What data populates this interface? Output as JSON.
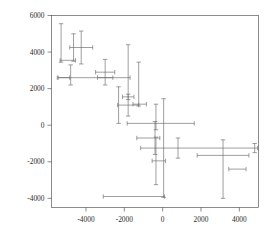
{
  "figure": {
    "background": "#ffffff",
    "line_color": "#6b6b6b",
    "axis_color": "#5a5a5a"
  },
  "chart_data": {
    "type": "scatter",
    "title": "",
    "xlabel": "",
    "ylabel": "",
    "xlim": [
      -5800,
      5000
    ],
    "ylim": [
      -4500,
      6000
    ],
    "grid": false,
    "legend": null,
    "error_bars": "both",
    "xticks": [
      -4000,
      -2000,
      0,
      2000,
      4000
    ],
    "xticklabels": [
      "-4000",
      "-2000",
      "0",
      "2000",
      "4000"
    ],
    "yticks": [
      -4000,
      -2000,
      0,
      2000,
      4000,
      6000
    ],
    "yticklabels": [
      "-4000",
      "-2000",
      "0",
      "2000",
      "4000",
      "6000"
    ],
    "points": [
      {
        "x": -5300,
        "y": 4500,
        "xerr": 0,
        "yerr": 1050
      },
      {
        "x": -5150,
        "y": 2600,
        "xerr": 300,
        "yerr": 0
      },
      {
        "x": -4950,
        "y": 3550,
        "xerr": 400,
        "yerr": 0
      },
      {
        "x": -4800,
        "y": 2750,
        "xerr": 0,
        "yerr": 550
      },
      {
        "x": -4650,
        "y": 4250,
        "xerr": 0,
        "yerr": 750
      },
      {
        "x": -4250,
        "y": 4250,
        "xerr": 600,
        "yerr": 900
      },
      {
        "x": -4050,
        "y": 2600,
        "xerr": 1450,
        "yerr": 0
      },
      {
        "x": -3000,
        "y": 2900,
        "xerr": 500,
        "yerr": 700
      },
      {
        "x": -2550,
        "y": 2600,
        "xerr": 850,
        "yerr": 0
      },
      {
        "x": -1800,
        "y": 2900,
        "xerr": 0,
        "yerr": 1500
      },
      {
        "x": -1800,
        "y": 1550,
        "xerr": 300,
        "yerr": 0
      },
      {
        "x": -2300,
        "y": 1100,
        "xerr": 0,
        "yerr": 1000
      },
      {
        "x": -1800,
        "y": 1100,
        "xerr": 550,
        "yerr": 600
      },
      {
        "x": -1250,
        "y": 2250,
        "xerr": 0,
        "yerr": 1200
      },
      {
        "x": -1200,
        "y": 1150,
        "xerr": 350,
        "yerr": 0
      },
      {
        "x": -350,
        "y": 450,
        "xerr": 0,
        "yerr": 700
      },
      {
        "x": -100,
        "y": 100,
        "xerr": 1750,
        "yerr": 0
      },
      {
        "x": -750,
        "y": -700,
        "xerr": 600,
        "yerr": 0
      },
      {
        "x": -400,
        "y": -700,
        "xerr": 0,
        "yerr": 900
      },
      {
        "x": -350,
        "y": -1950,
        "xerr": 0,
        "yerr": 1300
      },
      {
        "x": -200,
        "y": -1950,
        "xerr": 350,
        "yerr": 0
      },
      {
        "x": 50,
        "y": -1250,
        "xerr": 0,
        "yerr": 2700
      },
      {
        "x": 1900,
        "y": -1250,
        "xerr": 3050,
        "yerr": 0
      },
      {
        "x": 800,
        "y": -1250,
        "xerr": 0,
        "yerr": 550
      },
      {
        "x": 3150,
        "y": -1650,
        "xerr": 1350,
        "yerr": 0
      },
      {
        "x": 3150,
        "y": -2400,
        "xerr": 0,
        "yerr": 1600
      },
      {
        "x": 3900,
        "y": -2400,
        "xerr": 450,
        "yerr": 0
      },
      {
        "x": 4800,
        "y": -1250,
        "xerr": 0,
        "yerr": 250
      },
      {
        "x": -1500,
        "y": -3900,
        "xerr": 1600,
        "yerr": 0
      }
    ]
  }
}
